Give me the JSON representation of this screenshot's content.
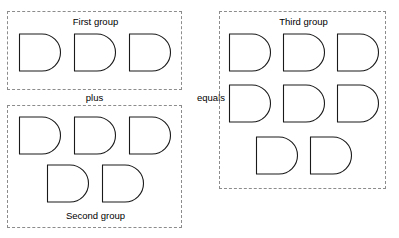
{
  "canvas": {
    "width": 399,
    "height": 238,
    "background_color": "#ffffff",
    "stroke_color": "#1a1a1a",
    "dashed_border_color": "#8c8c8c"
  },
  "diagram": {
    "type": "set-addition-illustration",
    "shape_glyph": "d-shape"
  },
  "groups": [
    {
      "id": "first",
      "caption": "First group",
      "caption_position": "top",
      "count": 3,
      "shapes": [
        {
          "name": "d-shape",
          "x": 10,
          "y": 21
        },
        {
          "name": "d-shape",
          "x": 65,
          "y": 21
        },
        {
          "name": "d-shape",
          "x": 120,
          "y": 21
        }
      ]
    },
    {
      "id": "second",
      "caption": "Second group",
      "caption_position": "bottom",
      "count": 5,
      "shapes": [
        {
          "name": "d-shape",
          "x": 10,
          "y": 10
        },
        {
          "name": "d-shape",
          "x": 65,
          "y": 10
        },
        {
          "name": "d-shape",
          "x": 120,
          "y": 10
        },
        {
          "name": "d-shape",
          "x": 38,
          "y": 58
        },
        {
          "name": "d-shape",
          "x": 93,
          "y": 58
        }
      ]
    },
    {
      "id": "third",
      "caption": "Third group",
      "caption_position": "top",
      "count": 8,
      "shapes": [
        {
          "name": "d-shape",
          "x": 8,
          "y": 21
        },
        {
          "name": "d-shape",
          "x": 62,
          "y": 21
        },
        {
          "name": "d-shape",
          "x": 116,
          "y": 21
        },
        {
          "name": "d-shape",
          "x": 8,
          "y": 72
        },
        {
          "name": "d-shape",
          "x": 62,
          "y": 72
        },
        {
          "name": "d-shape",
          "x": 116,
          "y": 72
        },
        {
          "name": "d-shape",
          "x": 35,
          "y": 124
        },
        {
          "name": "d-shape",
          "x": 89,
          "y": 124
        }
      ]
    }
  ],
  "operators": {
    "plus": "plus",
    "equals": "equals"
  }
}
